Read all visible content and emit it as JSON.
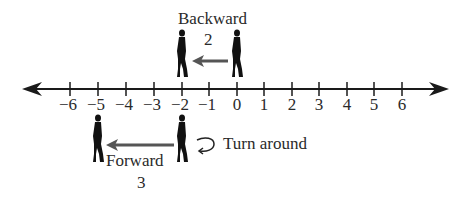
{
  "diagram": {
    "number_line": {
      "min": -6,
      "max": 6,
      "ticks": [
        {
          "value": -6,
          "label": "−6"
        },
        {
          "value": -5,
          "label": "−5"
        },
        {
          "value": -4,
          "label": "−4"
        },
        {
          "value": -3,
          "label": "−3"
        },
        {
          "value": -2,
          "label": "−2"
        },
        {
          "value": -1,
          "label": "−1"
        },
        {
          "value": 0,
          "label": "0"
        },
        {
          "value": 1,
          "label": "1"
        },
        {
          "value": 2,
          "label": "2"
        },
        {
          "value": 3,
          "label": "3"
        },
        {
          "value": 4,
          "label": "4"
        },
        {
          "value": 5,
          "label": "5"
        },
        {
          "value": 6,
          "label": "6"
        }
      ],
      "arrows_both_ends": true
    },
    "step1": {
      "label": "Backward",
      "amount": "2",
      "from": 0,
      "to": -2
    },
    "step2": {
      "turn_label": "Turn around",
      "label": "Forward",
      "amount": "3",
      "from": -2,
      "to": -5
    },
    "colors": {
      "line": "#1a1a1a",
      "figure": "#111111",
      "arrow": "#555555",
      "text": "#2a2a2a"
    }
  }
}
